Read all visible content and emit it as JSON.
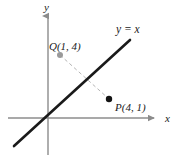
{
  "figure": {
    "background_color": "#ffffff",
    "axis_color": "#8c8c8c",
    "line_color": "#1a1a1a",
    "dash_color": "#b5b5b5",
    "text_color": "#1a1a1a"
  },
  "axes": {
    "x_label": "x",
    "y_label": "y",
    "x_axis": {
      "x1": 8,
      "y1": 118,
      "x2": 160,
      "y2": 118
    },
    "y_axis": {
      "x1": 48,
      "y1": 10,
      "x2": 48,
      "y2": 155
    },
    "origin": {
      "x": 48,
      "y": 118
    },
    "x_label_pos": {
      "x": 165,
      "y": 122
    },
    "y_label_pos": {
      "x": 44,
      "y": 11
    }
  },
  "chart_data": {
    "type": "scatter",
    "title": "",
    "xlabel": "x",
    "ylabel": "y",
    "grid": false,
    "legend": null,
    "annotations": [
      {
        "text": "y = x",
        "kind": "line-label"
      },
      {
        "text": "Q(1, 4)",
        "kind": "point-label"
      },
      {
        "text": "P(4, 1)",
        "kind": "point-label"
      }
    ],
    "lines": [
      {
        "name": "y = x",
        "label": "y = x",
        "equation": "y = x",
        "slope": 1,
        "intercept": 0,
        "style": "solid",
        "color": "#1a1a1a",
        "width": 2.6,
        "pixel_endpoints": {
          "x1": 14,
          "y1": 146,
          "x2": 130,
          "y2": 40
        },
        "label_pos": {
          "x": 116,
          "y": 33
        }
      },
      {
        "name": "QP-connector",
        "label": "",
        "style": "dashed",
        "color": "#b5b5b5",
        "width": 1,
        "pixel_endpoints": {
          "x1": 60,
          "y1": 55,
          "x2": 109,
          "y2": 99
        }
      }
    ],
    "points": [
      {
        "name": "Q",
        "label": "Q(1, 4)",
        "x": 1,
        "y": 4,
        "color": "#9a9a9a",
        "radius": 3,
        "pixel": {
          "x": 60,
          "y": 55
        },
        "label_pos": {
          "x": 49,
          "y": 50
        },
        "label_anchor": "start"
      },
      {
        "name": "P",
        "label": "P(4, 1)",
        "x": 4,
        "y": 1,
        "color": "#141414",
        "radius": 3.2,
        "pixel": {
          "x": 109,
          "y": 99
        },
        "label_pos": {
          "x": 115,
          "y": 111
        },
        "label_anchor": "start"
      }
    ]
  }
}
